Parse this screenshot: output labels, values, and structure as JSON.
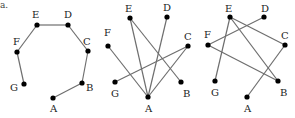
{
  "part_label": "a.",
  "colors": {
    "edge": "#6e6e6e",
    "node": "#000000",
    "label": "#222222"
  },
  "graphs": [
    {
      "id": "graph-1",
      "nodes": [
        {
          "label": "A",
          "x": 53,
          "y": 98,
          "lx": 50,
          "ly": 112
        },
        {
          "label": "B",
          "x": 82,
          "y": 83,
          "lx": 86,
          "ly": 91
        },
        {
          "label": "C",
          "x": 88,
          "y": 51,
          "lx": 83,
          "ly": 45
        },
        {
          "label": "D",
          "x": 68,
          "y": 25,
          "lx": 64,
          "ly": 18
        },
        {
          "label": "E",
          "x": 37,
          "y": 25,
          "lx": 32,
          "ly": 18
        },
        {
          "label": "F",
          "x": 17,
          "y": 52,
          "lx": 13,
          "ly": 45
        },
        {
          "label": "G",
          "x": 24,
          "y": 84,
          "lx": 10,
          "ly": 91
        }
      ],
      "edges": [
        [
          "A",
          "B"
        ],
        [
          "B",
          "C"
        ],
        [
          "C",
          "D"
        ],
        [
          "D",
          "E"
        ],
        [
          "E",
          "F"
        ],
        [
          "F",
          "G"
        ]
      ]
    },
    {
      "id": "graph-2",
      "nodes": [
        {
          "label": "A",
          "x": 148,
          "y": 97,
          "lx": 145,
          "ly": 112
        },
        {
          "label": "B",
          "x": 181,
          "y": 82,
          "lx": 183,
          "ly": 97
        },
        {
          "label": "C",
          "x": 188,
          "y": 46,
          "lx": 184,
          "ly": 40
        },
        {
          "label": "D",
          "x": 167,
          "y": 17,
          "lx": 163,
          "ly": 11
        },
        {
          "label": "E",
          "x": 130,
          "y": 18,
          "lx": 125,
          "ly": 12
        },
        {
          "label": "F",
          "x": 108,
          "y": 46,
          "lx": 104,
          "ly": 36
        },
        {
          "label": "G",
          "x": 115,
          "y": 82,
          "lx": 111,
          "ly": 97
        }
      ],
      "edges": [
        [
          "F",
          "A"
        ],
        [
          "E",
          "A"
        ],
        [
          "E",
          "B"
        ],
        [
          "D",
          "A"
        ],
        [
          "C",
          "G"
        ],
        [
          "C",
          "A"
        ]
      ]
    },
    {
      "id": "graph-3",
      "nodes": [
        {
          "label": "A",
          "x": 247,
          "y": 97,
          "lx": 244,
          "ly": 112
        },
        {
          "label": "B",
          "x": 278,
          "y": 81,
          "lx": 280,
          "ly": 96
        },
        {
          "label": "C",
          "x": 285,
          "y": 45,
          "lx": 281,
          "ly": 39
        },
        {
          "label": "D",
          "x": 264,
          "y": 17,
          "lx": 261,
          "ly": 12
        },
        {
          "label": "E",
          "x": 230,
          "y": 17,
          "lx": 225,
          "ly": 12
        },
        {
          "label": "F",
          "x": 208,
          "y": 45,
          "lx": 204,
          "ly": 38
        },
        {
          "label": "G",
          "x": 215,
          "y": 81,
          "lx": 211,
          "ly": 96
        }
      ],
      "edges": [
        [
          "E",
          "G"
        ],
        [
          "E",
          "C"
        ],
        [
          "E",
          "B"
        ],
        [
          "D",
          "F"
        ],
        [
          "F",
          "B"
        ],
        [
          "C",
          "A"
        ]
      ]
    }
  ]
}
